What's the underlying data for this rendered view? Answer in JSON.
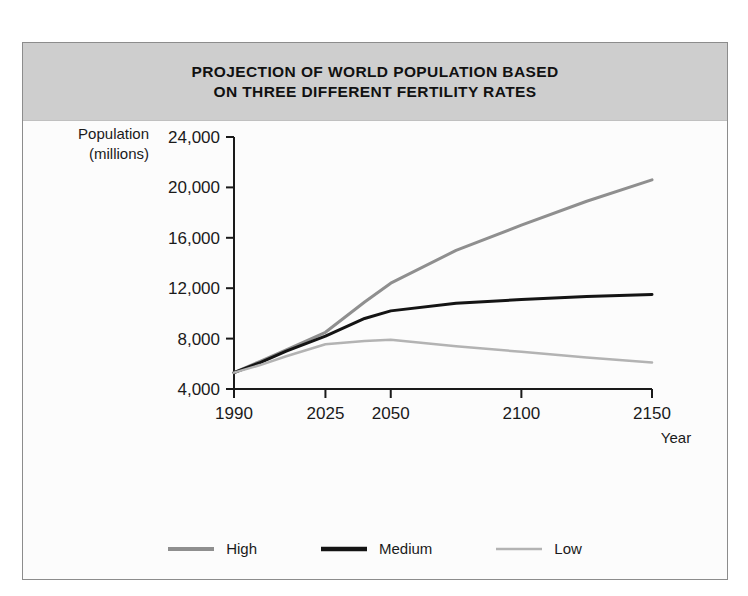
{
  "figure": {
    "title_line1": "PROJECTION OF WORLD POPULATION BASED",
    "title_line2": "ON THREE DIFFERENT FERTILITY RATES",
    "title_band_color": "#cecece",
    "frame_color": "#8c8c8c",
    "background": "#fcfcfc"
  },
  "chart_data": {
    "type": "line",
    "title": "PROJECTION OF WORLD POPULATION BASED ON THREE DIFFERENT FERTILITY RATES",
    "xlabel": "Year",
    "ylabel": "Population (millions)",
    "ylabel_line1": "Population",
    "ylabel_line2": "(millions)",
    "x_tick_labels": [
      "1990",
      "2025",
      "2050",
      "2100",
      "2150"
    ],
    "x_tick_values": [
      1990,
      2025,
      2050,
      2100,
      2150
    ],
    "xlim": [
      1990,
      2150
    ],
    "y_tick_labels": [
      "4,000",
      "8,000",
      "12,000",
      "16,000",
      "20,000",
      "24,000"
    ],
    "y_tick_values": [
      4000,
      8000,
      12000,
      16000,
      20000,
      24000
    ],
    "ylim": [
      4000,
      24000
    ],
    "grid": false,
    "legend_position": "bottom",
    "x": [
      1990,
      2000,
      2010,
      2025,
      2040,
      2050,
      2075,
      2100,
      2125,
      2150
    ],
    "series": [
      {
        "name": "High",
        "color": "#8f8f8f",
        "width": 3,
        "values": [
          5300,
          6200,
          7100,
          8500,
          10900,
          12400,
          15000,
          17000,
          18900,
          20600
        ]
      },
      {
        "name": "Medium",
        "color": "#141414",
        "width": 3,
        "values": [
          5300,
          6100,
          7000,
          8200,
          9600,
          10200,
          10800,
          11100,
          11350,
          11500
        ]
      },
      {
        "name": "Low",
        "color": "#b3b3b3",
        "width": 2.5,
        "values": [
          5300,
          5900,
          6600,
          7550,
          7800,
          7900,
          7400,
          6950,
          6500,
          6100
        ]
      }
    ]
  },
  "legend": {
    "items": [
      {
        "label": "High",
        "color": "#8f8f8f",
        "width": 4
      },
      {
        "label": "Medium",
        "color": "#141414",
        "width": 4.5
      },
      {
        "label": "Low",
        "color": "#b3b3b3",
        "width": 2.5
      }
    ]
  }
}
